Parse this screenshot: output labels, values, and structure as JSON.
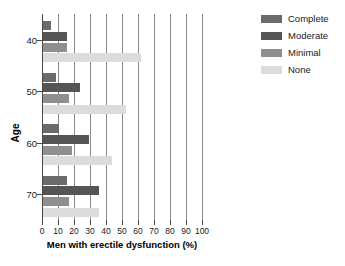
{
  "chart_data": {
    "type": "bar",
    "orientation": "horizontal",
    "title": "",
    "xlabel": "Men with erectile dysfunction (%)",
    "ylabel": "Age",
    "xlim": [
      0,
      100
    ],
    "xticks": [
      0,
      10,
      20,
      30,
      40,
      50,
      60,
      70,
      80,
      90,
      100
    ],
    "xtick_labels": [
      "0",
      "10",
      "20",
      "30",
      "40",
      "50",
      "60",
      "70",
      "80",
      "90",
      "100"
    ],
    "categories": [
      "40",
      "50",
      "60",
      "70"
    ],
    "ytick_labels": [
      "40",
      "50",
      "60",
      "70"
    ],
    "grid": "vertical",
    "legend_position": "top-right",
    "series": [
      {
        "name": "Complete",
        "color": "#6b6b6b",
        "values": [
          5,
          8,
          10,
          15
        ]
      },
      {
        "name": "Moderate",
        "color": "#555555",
        "values": [
          15,
          23,
          29,
          35
        ]
      },
      {
        "name": "Minimal",
        "color": "#8f8f8f",
        "values": [
          15,
          16,
          18,
          16
        ]
      },
      {
        "name": "None",
        "color": "#dcdcdc",
        "values": [
          61,
          52,
          43,
          35
        ]
      }
    ]
  },
  "legend": {
    "items": [
      {
        "label": "Complete"
      },
      {
        "label": "Moderate"
      },
      {
        "label": "Minimal"
      },
      {
        "label": "None"
      }
    ]
  }
}
